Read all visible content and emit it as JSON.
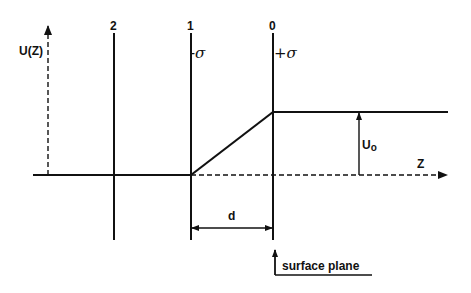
{
  "diagram": {
    "type": "potential-profile",
    "axes": {
      "y_label": "U(Z)",
      "x_label": "Z"
    },
    "planes": [
      {
        "id": "2",
        "label": "2",
        "charge": ""
      },
      {
        "id": "1",
        "label": "1",
        "charge": "-σ"
      },
      {
        "id": "0",
        "label": "0",
        "charge": "+σ"
      }
    ],
    "annotations": {
      "step_height": "U",
      "step_height_sub": "o",
      "separation": "d",
      "surface": "surface plane"
    },
    "colors": {
      "line": "#111111",
      "background": "#ffffff"
    }
  }
}
